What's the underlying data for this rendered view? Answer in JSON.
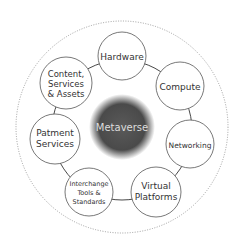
{
  "diagram": {
    "title": "Metaverse",
    "center": {
      "label": "Metaverse",
      "color": "#4a4a4a"
    },
    "outer_ring": {
      "style": "dotted",
      "color": "#888888"
    },
    "nodes": [
      {
        "id": "hardware",
        "lines": [
          "Hardware"
        ]
      },
      {
        "id": "compute",
        "lines": [
          "Compute"
        ]
      },
      {
        "id": "networking",
        "lines": [
          "Networking"
        ]
      },
      {
        "id": "virtual-platforms",
        "lines": [
          "Virtual",
          "Platforms"
        ]
      },
      {
        "id": "interchange",
        "lines": [
          "Interchange",
          "Tools &",
          "Standards"
        ]
      },
      {
        "id": "payment-services",
        "lines": [
          "Patment",
          "Services"
        ]
      },
      {
        "id": "content",
        "lines": [
          "Content,",
          "Services",
          "& Assets"
        ]
      }
    ]
  }
}
